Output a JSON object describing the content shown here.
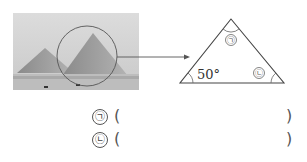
{
  "figure": {
    "photo_subject": "pyramids",
    "arrow": "arrow-right",
    "triangle": {
      "known_angle": "50°",
      "apex_label": "㉠",
      "right_label": "㉡"
    }
  },
  "answers": [
    {
      "label": "㉠",
      "open": "(",
      "close": ")",
      "value": ""
    },
    {
      "label": "㉡",
      "open": "(",
      "close": ")",
      "value": ""
    }
  ]
}
